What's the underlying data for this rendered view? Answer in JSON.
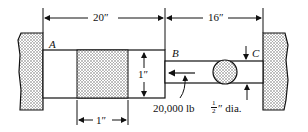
{
  "diagram": {
    "dimensions": {
      "length_AB": "20″",
      "length_BC": "16″",
      "collar_width": "1″",
      "shaft_step_height": "1″"
    },
    "points": {
      "a": "A",
      "b": "B",
      "c": "C"
    },
    "load": "20,000 lb",
    "rod_diameter": {
      "fraction_num": "1",
      "fraction_den": "2",
      "suffix": "″ dia."
    }
  }
}
